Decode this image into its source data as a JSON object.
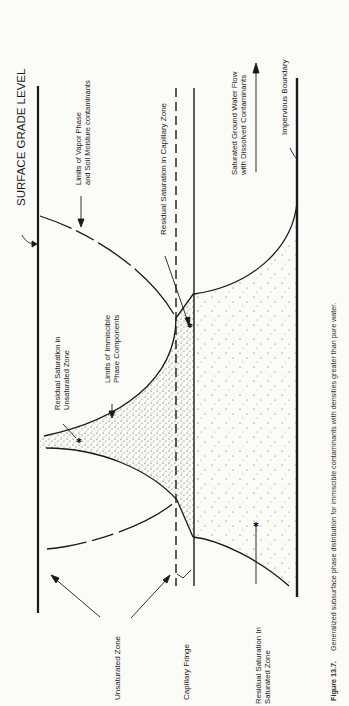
{
  "figure": {
    "title": "SURFACE GRADE LEVEL",
    "labels": {
      "vapor_limits_line1": "Limits of Vapor Phase",
      "vapor_limits_line2": "and Soil Moisture contaminants",
      "residual_capillary": "Residual Saturation in Capillary Zone",
      "gw_flow_line1": "Saturated Ground Water Flow",
      "gw_flow_line2": "with Dissolved Contaminants",
      "impervious": "Impervious Boundary",
      "residual_unsat_line1": "Residual Saturation in",
      "residual_unsat_line2": "Unsaturated Zone",
      "immiscible_line1": "Limits of Immiscible",
      "immiscible_line2": "Phase Components",
      "unsaturated_zone": "Unsaturated Zone",
      "capillary_fringe": "Capillary Fringe",
      "residual_sat_line1": "Residual Saturation In",
      "residual_sat_line2": "Saturated Zone"
    },
    "caption_label": "Figure 13.7.",
    "caption_text": "Generalized subsurface phase distribution for immiscible contaminants with densities greater than pure water."
  },
  "colors": {
    "line": "#1a1a1a",
    "background": "#fbfbf8",
    "stipple": "#333333"
  }
}
